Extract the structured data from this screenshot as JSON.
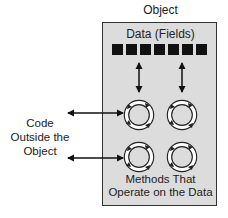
{
  "diagram": {
    "object_label": "Object",
    "data_label": "Data (Fields)",
    "field_count": 7,
    "fields": [
      "field",
      "field",
      "field",
      "field",
      "field",
      "field",
      "field"
    ],
    "methods_label_line1": "Methods That",
    "methods_label_line2": "Operate on the Data",
    "outside_label_line1": "Code",
    "outside_label_line2": "Outside the",
    "outside_label_line3": "Object",
    "method_icon": "circular-arrows-icon",
    "method_count": 4,
    "colors": {
      "box_fill": "#dcdcdc",
      "box_border": "#333333",
      "field_fill": "#111111",
      "arrow": "#111111",
      "text": "#222222"
    }
  }
}
